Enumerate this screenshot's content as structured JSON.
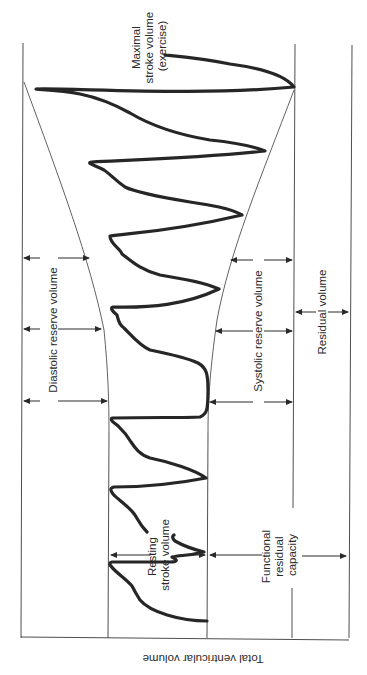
{
  "figure": {
    "axis_label": "Total ventricular volume",
    "labels": {
      "maximal_stroke_volume": [
        "Maximal",
        "stroke volume",
        "(exercise)"
      ],
      "diastolic_reserve_volume": "Diastolic reserve volume",
      "systolic_reserve_volume": "Systolic reserve volume",
      "residual_volume": "Residual volume",
      "resting_stroke_volume": [
        "Resting",
        "stroke volume"
      ],
      "functional_residual_capacity": [
        "Functional",
        "residual",
        "capacity"
      ]
    },
    "colors": {
      "line": "#3a3a3a",
      "trace": "#262626",
      "background": "#ffffff"
    },
    "orientation": "rotated 90 degrees clockwise (time runs bottom to top)"
  }
}
